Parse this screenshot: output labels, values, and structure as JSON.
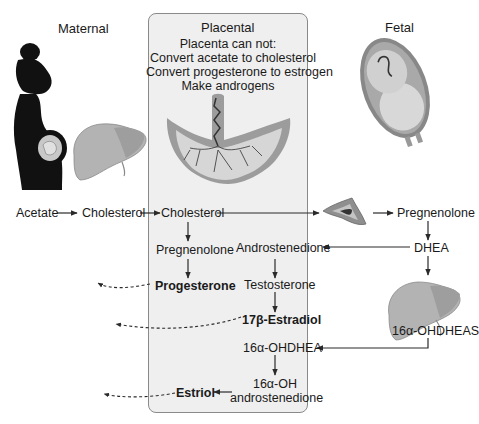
{
  "columns": {
    "maternal": "Maternal",
    "placental": "Placental",
    "fetal": "Fetal"
  },
  "placenta_note": {
    "line1": "Placenta can not:",
    "line2": "Convert acetate to cholesterol",
    "line3": "Convert progesterone to estrogen",
    "line4": "Make androgens"
  },
  "nodes": {
    "acetate": "Acetate",
    "cholesterol_maternal": "Cholesterol",
    "cholesterol_placental": "Cholesterol",
    "pregnenolone_placental": "Pregnenolone",
    "progesterone": "Progesterone",
    "androstenedione": "Androstenedione",
    "testosterone": "Testosterone",
    "estradiol": "17β-Estradiol",
    "ohdhea": "16α-OHDHEA",
    "oh_androstenedione_1": "16α-OH",
    "oh_androstenedione_2": "androstenedione",
    "estriol": "Estriol",
    "pregnenolone_fetal": "Pregnenolone",
    "dhea": "DHEA",
    "ohdheas": "16α-OHDHEAS"
  },
  "illustrations": {
    "pregnant_woman": "pregnant-woman-silhouette",
    "maternal_liver": "liver",
    "placenta": "placenta",
    "fetus": "fetus-in-uterus",
    "fetal_adrenal": "adrenal-gland",
    "fetal_liver": "liver"
  },
  "colors": {
    "panel_bg": "#efefef",
    "panel_border": "#8a8a8a",
    "arrow": "#2a2a2a",
    "organ_gray": "#a8a8a8"
  }
}
